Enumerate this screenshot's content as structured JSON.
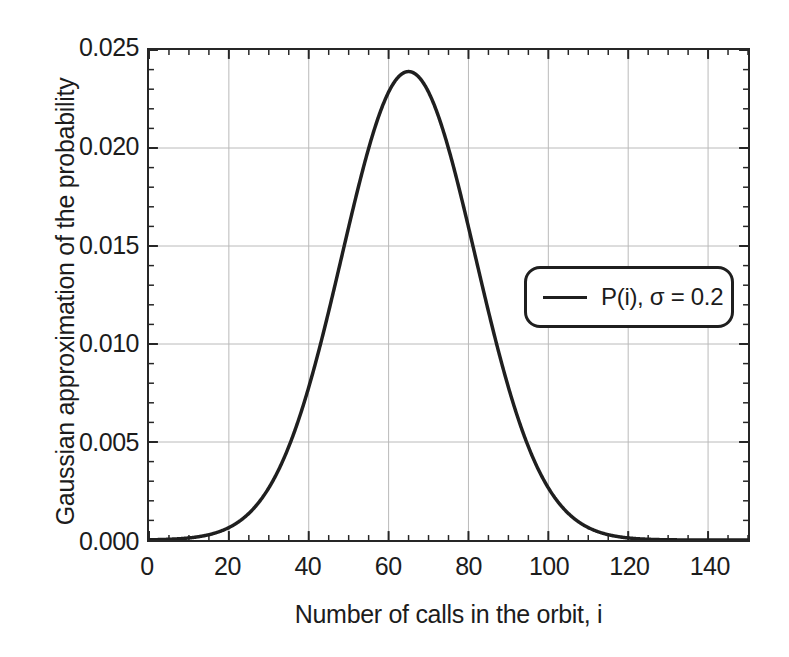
{
  "chart_data": {
    "type": "line",
    "title": "",
    "xlabel": "Number of calls in the orbit, i",
    "ylabel": "Gaussian approximation of the probability",
    "xlim": [
      0,
      150
    ],
    "ylim": [
      0.0,
      0.025
    ],
    "xticks": [
      0,
      20,
      40,
      60,
      80,
      100,
      120,
      140
    ],
    "xtick_labels": [
      "0",
      "20",
      "40",
      "60",
      "80",
      "100",
      "120",
      "140"
    ],
    "yticks": [
      0.0,
      0.005,
      0.01,
      0.015,
      0.02,
      0.025
    ],
    "ytick_labels": [
      "0.000",
      "0.005",
      "0.010",
      "0.015",
      "0.020",
      "0.025"
    ],
    "x_minor_tick_interval": 5,
    "y_minor_tick_interval": 0.001,
    "grid": true,
    "grid_color": "#b9b9b9",
    "legend_position": "center-right",
    "line_color": "#1f1f1f",
    "line_width": 3.5,
    "peak": {
      "x": 65,
      "y": 0.0239
    },
    "series": [
      {
        "name": "P(i), σ = 0.2",
        "mean": 65,
        "sigma": 16.7,
        "amplitude": 0.0239,
        "x": [
          0,
          5,
          10,
          15,
          20,
          25,
          30,
          35,
          40,
          45,
          50,
          55,
          60,
          65,
          70,
          75,
          80,
          85,
          90,
          95,
          100,
          105,
          110,
          115,
          120,
          125,
          130,
          135,
          140,
          145,
          150
        ],
        "values": [
          0.0,
          1e-05,
          3e-05,
          0.0001,
          0.00028,
          0.00069,
          0.0015,
          0.0029,
          0.005,
          0.00775,
          0.0108,
          0.0159,
          0.0199,
          0.0239,
          0.0233,
          0.0207,
          0.0168,
          0.0122,
          0.0079,
          0.0046,
          0.0024,
          0.00112,
          0.00047,
          0.00018,
          6e-05,
          2e-05,
          1e-05,
          0.0,
          0.0,
          0.0,
          0.0
        ]
      }
    ]
  },
  "legend": {
    "entries": [
      {
        "label": "P(i), σ = 0.2",
        "color": "#1f1f1f"
      }
    ]
  },
  "axes": {
    "x_title": "Number of calls in the orbit, i",
    "y_title": "Gaussian approximation of the probability"
  }
}
